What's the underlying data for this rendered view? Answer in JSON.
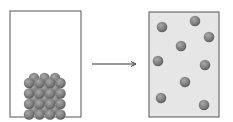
{
  "diagram": {
    "title": "",
    "left_container": {
      "state": "solid",
      "fill": "#ffffff",
      "border": "#555555",
      "particle_grid": {
        "rows": 4,
        "cols": 4,
        "depth_layers": 2
      }
    },
    "arrow": {
      "direction": "right",
      "color": "#333333"
    },
    "right_container": {
      "state": "gas",
      "fill": "#e6e6e6",
      "border": "#555555",
      "particle_count": 9
    },
    "particle_color": "#7f7f7f",
    "particle_highlight": "#a9a9a9"
  }
}
